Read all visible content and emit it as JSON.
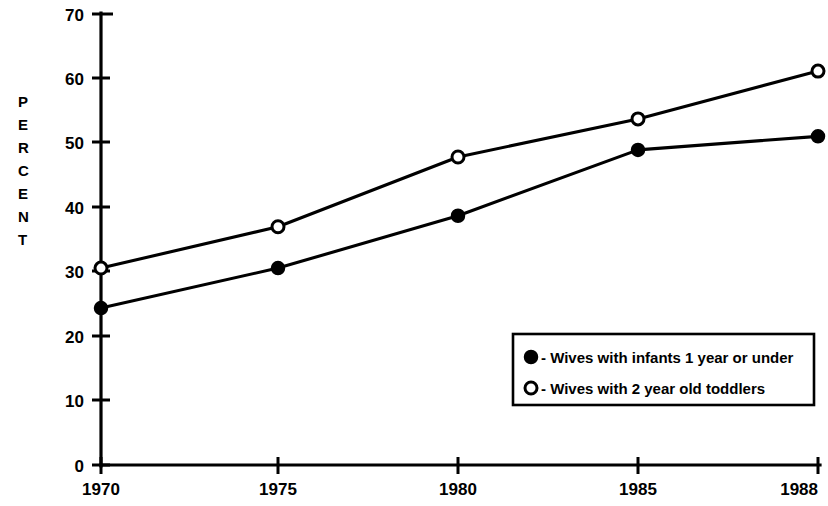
{
  "chart_data": {
    "type": "line",
    "title": "",
    "subtitle": "",
    "xlabel": "",
    "ylabel": "PERCENT",
    "x": [
      1970,
      1975,
      1980,
      1985,
      1988
    ],
    "xtick_labels": [
      "1970",
      "1975",
      "1980",
      "1985",
      "1988"
    ],
    "ytick_labels": [
      "0",
      "10",
      "20",
      "30",
      "40",
      "50",
      "60",
      "70"
    ],
    "yticks": [
      0,
      10,
      20,
      30,
      40,
      50,
      60,
      70
    ],
    "ylim": [
      0,
      70
    ],
    "grid": false,
    "legend_position": "lower-right-inside",
    "series": [
      {
        "name": "Wives with infants 1 year or under",
        "marker": "filled-circle",
        "values": [
          24.3,
          30.5,
          38.6,
          48.8,
          50.9
        ]
      },
      {
        "name": "Wives with 2 year old toddlers",
        "marker": "open-circle",
        "values": [
          30.5,
          36.9,
          47.7,
          53.6,
          61.0
        ]
      }
    ]
  },
  "axis": {
    "y_label_letters": [
      "P",
      "E",
      "R",
      "C",
      "E",
      "N",
      "T"
    ],
    "y_tick_0": "0",
    "y_tick_10": "10",
    "y_tick_20": "20",
    "y_tick_30": "30",
    "y_tick_40": "40",
    "y_tick_50": "50",
    "y_tick_60": "60",
    "y_tick_70": "70",
    "x_tick_1970": "1970",
    "x_tick_1975": "1975",
    "x_tick_1980": "1980",
    "x_tick_1985": "1985",
    "x_tick_1988": "1988"
  },
  "legend": {
    "entry_1_label": "- Wives with infants 1 year or under",
    "entry_2_label": "- Wives with 2 year old toddlers"
  },
  "colors": {
    "ink": "#000000",
    "paper": "#ffffff"
  }
}
